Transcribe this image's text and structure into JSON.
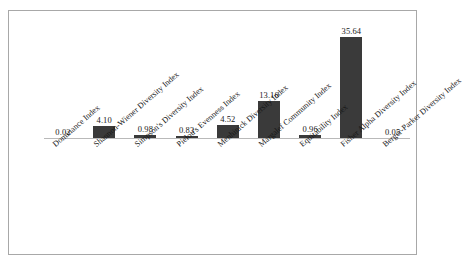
{
  "chart_data": {
    "type": "bar",
    "title": "",
    "subtitle": "",
    "xlabel": "",
    "ylabel": "",
    "grid": false,
    "legend": "none",
    "ylim": [
      0,
      38
    ],
    "axis_visible": true,
    "bar_color": "#3a3a3a",
    "categories": [
      "Dominance Index",
      "Shannon-Wiener Diversity Index",
      "Simpson's Diversity Index",
      "Pielou's Evenness Index",
      "Menhinick Diversity Index",
      "Margalef Community Index",
      "Equitability Index",
      "Fisher Alpha Diversity Index",
      "Berger-Parker Diversity Index"
    ],
    "values": [
      0.02,
      4.1,
      0.98,
      0.83,
      4.52,
      13.16,
      0.96,
      35.64,
      0.05
    ],
    "value_labels": [
      "0.02",
      "4.10",
      "0.98",
      "0.83",
      "4.52",
      "13.16",
      "0.96",
      "35.64",
      "0.05"
    ]
  },
  "figure": {
    "border_color": "#a8a8a8",
    "background": "#ffffff",
    "axis_color": "#b9b9b9"
  }
}
